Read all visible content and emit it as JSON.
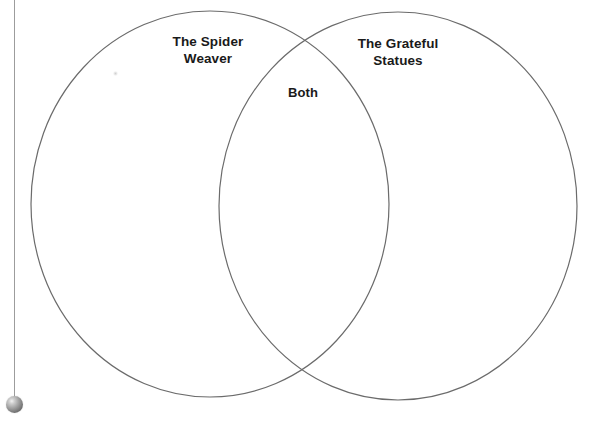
{
  "page": {
    "background_color": "#ffffff",
    "width": 605,
    "height": 427
  },
  "diagram": {
    "type": "venn",
    "set_count": 2,
    "stroke_color": "#6b6b6b",
    "stroke_width": 1.2,
    "fill": "none",
    "circles": [
      {
        "id": "left",
        "label": "The Spider Weaver",
        "label_lines": [
          "The Spider",
          "Weaver"
        ],
        "cx": 210,
        "cy": 204,
        "rx": 179,
        "ry": 193
      },
      {
        "id": "right",
        "label": "The Grateful Statues",
        "label_lines": [
          "The Grateful",
          "Statues"
        ],
        "cx": 398,
        "cy": 206,
        "rx": 179,
        "ry": 194
      }
    ],
    "intersection": {
      "label": "Both",
      "cx": 303,
      "top_y": 48,
      "bottom_y": 372
    },
    "labels": {
      "left": "The Spider\nWeaver",
      "right": "The Grateful\nStatues",
      "both": "Both"
    },
    "text_color": "#1a1a1a"
  },
  "artifacts": {
    "plumb_line": {
      "name": "scanner-plumb-line",
      "x": 14,
      "from_y": 0,
      "to_y": 398,
      "color": "#9a9a9a"
    },
    "plumb_bob": {
      "name": "scanner-plumb-bob",
      "cx": 14,
      "cy": 404,
      "radius": 8,
      "color": "#8a8a8a"
    },
    "speckle": {
      "name": "scan-speckle",
      "cx": 115,
      "cy": 73
    }
  }
}
